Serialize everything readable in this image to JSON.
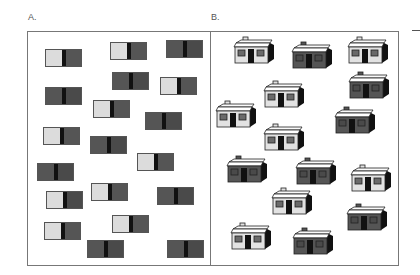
{
  "colors": {
    "light": "#dcdcdc",
    "dark": "#555555",
    "darker": "#4a4a4a",
    "divider": "#111111",
    "frame": "#777777"
  },
  "panel_a": {
    "label": "A.",
    "frame": {
      "x": 27,
      "y": 31,
      "w": 184,
      "h": 235
    },
    "stimuli": [
      {
        "x": 45,
        "y": 49,
        "left": "light",
        "right": "dark"
      },
      {
        "x": 110,
        "y": 42,
        "left": "light",
        "right": "dark"
      },
      {
        "x": 166,
        "y": 40,
        "left": "dark",
        "right": "darker"
      },
      {
        "x": 45,
        "y": 87,
        "left": "dark",
        "right": "darker"
      },
      {
        "x": 112,
        "y": 72,
        "left": "dark",
        "right": "darker"
      },
      {
        "x": 160,
        "y": 77,
        "left": "light",
        "right": "dark"
      },
      {
        "x": 93,
        "y": 100,
        "left": "light",
        "right": "dark"
      },
      {
        "x": 145,
        "y": 112,
        "left": "dark",
        "right": "darker"
      },
      {
        "x": 43,
        "y": 127,
        "left": "light",
        "right": "dark"
      },
      {
        "x": 90,
        "y": 136,
        "left": "dark",
        "right": "darker"
      },
      {
        "x": 137,
        "y": 153,
        "left": "light",
        "right": "dark"
      },
      {
        "x": 37,
        "y": 163,
        "left": "dark",
        "right": "darker"
      },
      {
        "x": 91,
        "y": 183,
        "left": "light",
        "right": "dark"
      },
      {
        "x": 157,
        "y": 187,
        "left": "dark",
        "right": "darker"
      },
      {
        "x": 46,
        "y": 191,
        "left": "light",
        "right": "darker"
      },
      {
        "x": 112,
        "y": 215,
        "left": "light",
        "right": "dark"
      },
      {
        "x": 44,
        "y": 222,
        "left": "light",
        "right": "dark"
      },
      {
        "x": 87,
        "y": 240,
        "left": "dark",
        "right": "darker"
      },
      {
        "x": 167,
        "y": 240,
        "left": "dark",
        "right": "darker"
      }
    ]
  },
  "panel_b": {
    "label": "B.",
    "frame": {
      "x": 210,
      "y": 31,
      "w": 189,
      "h": 235
    },
    "houses": [
      {
        "x": 232,
        "y": 35,
        "tone": "light"
      },
      {
        "x": 290,
        "y": 40,
        "tone": "dark"
      },
      {
        "x": 346,
        "y": 35,
        "tone": "light"
      },
      {
        "x": 262,
        "y": 79,
        "tone": "light"
      },
      {
        "x": 347,
        "y": 70,
        "tone": "dark"
      },
      {
        "x": 214,
        "y": 99,
        "tone": "light"
      },
      {
        "x": 333,
        "y": 105,
        "tone": "dark"
      },
      {
        "x": 262,
        "y": 122,
        "tone": "light"
      },
      {
        "x": 225,
        "y": 154,
        "tone": "dark"
      },
      {
        "x": 294,
        "y": 156,
        "tone": "dark"
      },
      {
        "x": 349,
        "y": 163,
        "tone": "light"
      },
      {
        "x": 270,
        "y": 186,
        "tone": "light"
      },
      {
        "x": 345,
        "y": 202,
        "tone": "dark"
      },
      {
        "x": 229,
        "y": 221,
        "tone": "light"
      },
      {
        "x": 291,
        "y": 226,
        "tone": "dark"
      }
    ]
  },
  "edge_mark": {
    "x": 412,
    "y": 30,
    "w": 8
  }
}
